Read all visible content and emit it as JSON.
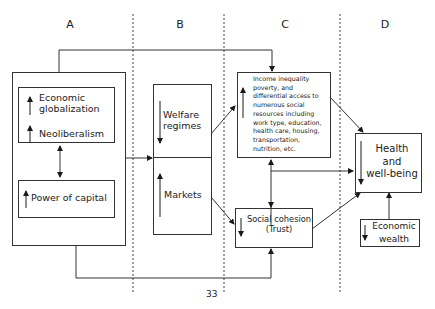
{
  "columns": [
    {
      "label": "A"
    },
    {
      "label": "B"
    },
    {
      "label": "C"
    },
    {
      "label": "D"
    }
  ],
  "nodes": {
    "economic_globalization": {
      "label_line1": "Economic",
      "label_line2": "globalization",
      "trend": "up"
    },
    "neoliberalism": {
      "label": "Neoliberalism",
      "trend": "up"
    },
    "power_of_capital": {
      "label": "Power of capital",
      "trend": "up"
    },
    "welfare_regimes": {
      "label_line1": "Welfare",
      "label_line2": "regimes",
      "trend": "down"
    },
    "markets": {
      "label": "Markets",
      "trend": "up"
    },
    "income_inequality": {
      "lines": [
        "Income inequality",
        "poverty, and",
        "differential access to",
        "numerous social",
        "resources including",
        "work type, education,",
        "health care, housing,",
        "transportation,",
        "nutrition, etc."
      ],
      "trend": "up"
    },
    "social_cohesion": {
      "label_line1": "Social cohesion",
      "label_line2": "(Trust)",
      "trend": "down"
    },
    "health": {
      "label_line1": "Health",
      "label_line2": "and",
      "label_line3": "well-being",
      "trend": "down"
    },
    "economic_wealth": {
      "label_line1": "Economic",
      "label_line2": "wealth",
      "trend": "down"
    }
  },
  "edges": [
    {
      "from": "column_A_box",
      "to": "income_inequality",
      "type": "top-loop"
    },
    {
      "from": "column_A_box",
      "to": "welfare_markets",
      "type": "arrow"
    },
    {
      "from": "globalization_neoliberalism",
      "to": "power_of_capital",
      "type": "bidirectional"
    },
    {
      "from": "welfare_regimes",
      "to": "income_inequality",
      "type": "arrow"
    },
    {
      "from": "markets",
      "to": "social_cohesion",
      "type": "arrow"
    },
    {
      "from": "income_inequality",
      "to": "social_cohesion",
      "type": "bidirectional"
    },
    {
      "from": "income_inequality",
      "to": "health",
      "type": "arrow"
    },
    {
      "from": "income_social_link",
      "to": "health",
      "type": "arrow"
    },
    {
      "from": "social_cohesion",
      "to": "health",
      "type": "arrow"
    },
    {
      "from": "economic_wealth",
      "to": "health",
      "type": "arrow"
    },
    {
      "from": "column_A_box",
      "to": "social_cohesion",
      "type": "bottom-loop"
    }
  ],
  "page_number": "33"
}
